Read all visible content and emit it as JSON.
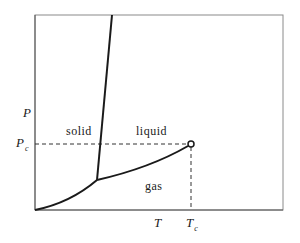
{
  "diagram": {
    "type": "phase-diagram",
    "axes": {
      "x_label": "T",
      "y_label": "P",
      "critical_temperature_label": "T",
      "critical_temperature_sub": "c",
      "critical_pressure_label": "P",
      "critical_pressure_sub": "c"
    },
    "regions": {
      "solid": "solid",
      "liquid": "liquid",
      "gas": "gas"
    },
    "curves": [
      {
        "name": "sublimation-curve",
        "from": "origin",
        "to": "triple-point"
      },
      {
        "name": "melting-curve",
        "from": "triple-point",
        "to": "top"
      },
      {
        "name": "vaporization-curve",
        "from": "triple-point",
        "to": "critical-point"
      }
    ],
    "points": {
      "triple_point": "triple-point",
      "critical_point": "critical-point"
    },
    "colors": {
      "frame": "#8a8a8a",
      "curve": "#1a1a1a",
      "dashed": "#333333"
    }
  }
}
